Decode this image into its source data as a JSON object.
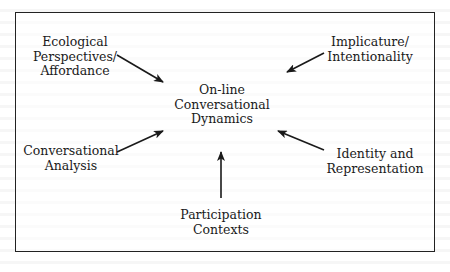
{
  "diagram": {
    "center": {
      "lines": [
        "On-line",
        "Conversational",
        "Dynamics"
      ]
    },
    "nodes": [
      {
        "id": "ecological",
        "lines": [
          "Ecological",
          "Perspectives/",
          "Affordance"
        ],
        "position": "top-left"
      },
      {
        "id": "implicature",
        "lines": [
          "Implicature/",
          "Intentionality"
        ],
        "position": "top-right"
      },
      {
        "id": "conversational-analysis",
        "lines": [
          "Conversational",
          "Analysis"
        ],
        "position": "bottom-left"
      },
      {
        "id": "identity",
        "lines": [
          "Identity and",
          "Representation"
        ],
        "position": "bottom-right"
      },
      {
        "id": "participation",
        "lines": [
          "Participation",
          "Contexts"
        ],
        "position": "bottom"
      }
    ],
    "edges": [
      {
        "from": "ecological",
        "to": "center"
      },
      {
        "from": "implicature",
        "to": "center"
      },
      {
        "from": "conversational-analysis",
        "to": "center"
      },
      {
        "from": "identity",
        "to": "center"
      },
      {
        "from": "participation",
        "to": "center"
      }
    ],
    "colors": {
      "stroke": "#1a1a1a",
      "text": "#1a1a1a",
      "background": "#ffffff"
    }
  }
}
